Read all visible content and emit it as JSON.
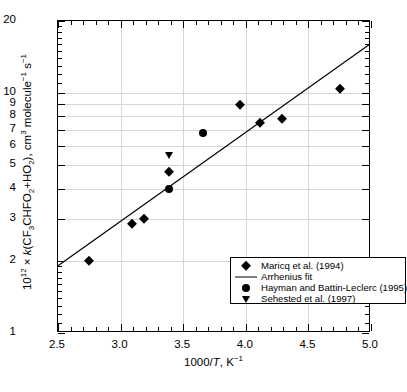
{
  "chart_data": {
    "type": "scatter",
    "title": "",
    "xlabel": "1000/T, K⁻¹",
    "ylabel": "10¹² × k(CF₃CHFO₂+HO₂), cm³ molecule⁻¹ s⁻¹",
    "xlim": [
      2.5,
      5.0
    ],
    "ylim": [
      1,
      20
    ],
    "yscale": "log",
    "xscale": "linear",
    "grid": true,
    "legend_position": "bottom-center-inside",
    "xticks": [
      "2.5",
      "3.0",
      "3.5",
      "4.0",
      "4.5",
      "5.0"
    ],
    "xtick_values": [
      2.5,
      3.0,
      3.5,
      4.0,
      4.5,
      5.0
    ],
    "yticks": [
      "1",
      "2",
      "3",
      "4",
      "5",
      "6",
      "7",
      "8",
      "9",
      "10",
      "20"
    ],
    "ytick_values": [
      1,
      2,
      3,
      4,
      5,
      6,
      7,
      8,
      9,
      10,
      20
    ],
    "series": [
      {
        "name": "Maricq et al. (1994)",
        "marker": "diamond",
        "color": "#000000",
        "points": [
          {
            "x": 2.75,
            "y": 2.0
          },
          {
            "x": 3.09,
            "y": 2.85
          },
          {
            "x": 3.19,
            "y": 3.0
          },
          {
            "x": 3.39,
            "y": 4.7
          },
          {
            "x": 3.95,
            "y": 8.9
          },
          {
            "x": 4.11,
            "y": 7.5
          },
          {
            "x": 4.29,
            "y": 7.8
          },
          {
            "x": 4.75,
            "y": 10.4
          }
        ]
      },
      {
        "name": "Hayman and Battin-Leclerc (1995)",
        "marker": "circle",
        "color": "#000000",
        "points": [
          {
            "x": 3.39,
            "y": 4.0
          },
          {
            "x": 3.66,
            "y": 6.8
          }
        ]
      },
      {
        "name": "Sehested et al. (1997)",
        "marker": "triangle-down",
        "color": "#000000",
        "points": [
          {
            "x": 3.39,
            "y": 5.5
          }
        ]
      },
      {
        "name": "Arrhenius fit",
        "marker": "line",
        "color": "#000000",
        "line": [
          {
            "x": 2.5,
            "y": 1.88
          },
          {
            "x": 5.0,
            "y": 15.9
          }
        ]
      }
    ]
  },
  "axes": {
    "x_title_prefix": "1000/",
    "x_title_italic": "T",
    "x_title_suffix": ", K",
    "x_title_sup": "−1",
    "y_title_html_parts": {
      "p1": "10",
      "sup1": "12",
      "p2": " × ",
      "ital_k": "k",
      "p3": "(CF",
      "sub3": "3",
      "p4": "CHFO",
      "sub2a": "2",
      "p5": "+HO",
      "sub2b": "2",
      "p6": "), cm",
      "sup3": "3",
      "p7": " molecule",
      "sup_m1a": "−1",
      "p8": " s",
      "sup_m1b": "−1"
    }
  },
  "legend": {
    "entries": [
      {
        "label": "Maricq et al. (1994)",
        "symbol": "diamond"
      },
      {
        "label": "Arrhenius fit",
        "symbol": "line"
      },
      {
        "label": "Hayman and Battin-Leclerc (1995)",
        "symbol": "circle"
      },
      {
        "label": "Sehested et al. (1997)",
        "symbol": "triangle-down"
      }
    ]
  },
  "caption": {
    "text": ""
  },
  "colors": {
    "axis": "#000000",
    "grid": "#d6d6d6",
    "marker": "#000000",
    "background": "#ffffff"
  }
}
